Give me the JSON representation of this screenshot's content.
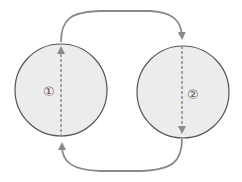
{
  "diagram": {
    "type": "cycle",
    "nodes": [
      {
        "id": "node-1",
        "label": "①",
        "cx": 61,
        "cy": 90,
        "r": 46
      },
      {
        "id": "node-2",
        "label": "②",
        "cx": 183,
        "cy": 92,
        "r": 46
      }
    ],
    "edges": [
      {
        "from": "node-1",
        "to": "node-2",
        "path": "top-arc"
      },
      {
        "from": "node-2",
        "to": "node-1",
        "path": "bottom-arc"
      }
    ],
    "colors": {
      "circle_fill": "#ececec",
      "circle_stroke": "#555555",
      "arrow": "#8a8a8a",
      "dashed": "#8a8a8a",
      "label": "#555555"
    }
  }
}
